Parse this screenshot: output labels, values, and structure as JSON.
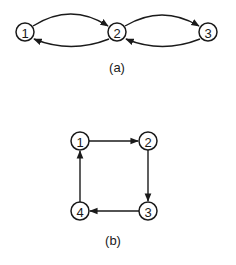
{
  "diagrams": [
    {
      "caption": "(a)",
      "nodes": [
        {
          "id": "a1",
          "label": "1",
          "x": 25,
          "y": 32
        },
        {
          "id": "a2",
          "label": "2",
          "x": 117,
          "y": 32
        },
        {
          "id": "a3",
          "label": "3",
          "x": 208,
          "y": 32
        }
      ],
      "edges": [
        {
          "from": "1",
          "to": "2",
          "curve": "upper"
        },
        {
          "from": "2",
          "to": "1",
          "curve": "lower"
        },
        {
          "from": "2",
          "to": "3",
          "curve": "upper"
        },
        {
          "from": "3",
          "to": "2",
          "curve": "lower"
        }
      ]
    },
    {
      "caption": "(b)",
      "nodes": [
        {
          "id": "b1",
          "label": "1",
          "x": 80,
          "y": 141
        },
        {
          "id": "b2",
          "label": "2",
          "x": 148,
          "y": 141
        },
        {
          "id": "b3",
          "label": "3",
          "x": 148,
          "y": 211
        },
        {
          "id": "b4",
          "label": "4",
          "x": 80,
          "y": 211
        }
      ],
      "edges": [
        {
          "from": "1",
          "to": "2"
        },
        {
          "from": "2",
          "to": "3"
        },
        {
          "from": "3",
          "to": "4"
        },
        {
          "from": "4",
          "to": "1"
        }
      ]
    }
  ]
}
